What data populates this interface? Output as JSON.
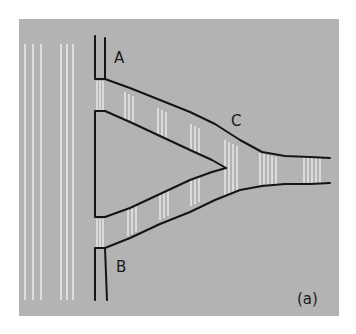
{
  "figure": {
    "panel_label": "(a)",
    "labels": {
      "inlet_a": "A",
      "inlet_b": "B",
      "junction": "C"
    },
    "colors": {
      "panel": "#b3b3b3",
      "background": "#ffffff",
      "lines": "#151515",
      "stripes": "#f2f2f2"
    }
  }
}
